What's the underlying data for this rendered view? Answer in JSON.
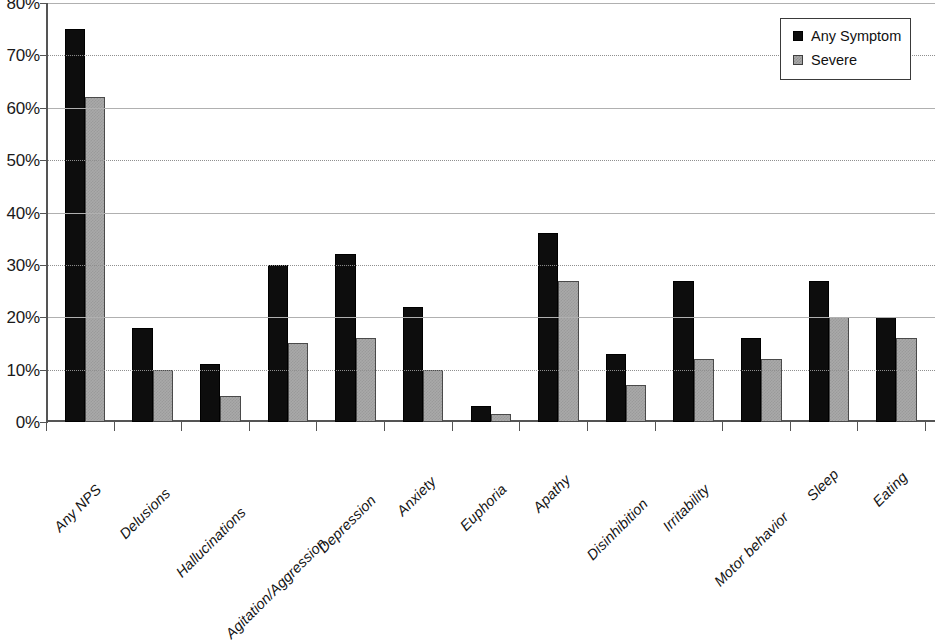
{
  "chart_data": {
    "type": "bar",
    "title": "",
    "subtitle": "",
    "xlabel": "",
    "ylabel": "",
    "ylim": [
      0,
      80
    ],
    "ytick_labels": [
      "0%",
      "10%",
      "20%",
      "30%",
      "40%",
      "50%",
      "60%",
      "70%",
      "80%"
    ],
    "ytick_values": [
      0,
      10,
      20,
      30,
      40,
      50,
      60,
      70,
      80
    ],
    "grid": true,
    "grid_axis": "y",
    "legend_position": "top-right",
    "categories": [
      "Any NPS",
      "Delusions",
      "Hallucinations",
      "Agitation/Aggression",
      "Depression",
      "Anxiety",
      "Euphoria",
      "Apathy",
      "Disinhibition",
      "Irritability",
      "Motor behavior",
      "Sleep",
      "Eating"
    ],
    "series": [
      {
        "name": "Any Symptom",
        "color": "#0d0d0d",
        "values": [
          75,
          18,
          11,
          30,
          32,
          22,
          3,
          36,
          13,
          27,
          16,
          27,
          20
        ]
      },
      {
        "name": "Severe",
        "color": "#a9a9a9",
        "values": [
          62,
          10,
          5,
          15,
          16,
          10,
          1.5,
          27,
          7,
          12,
          12,
          20,
          16
        ]
      }
    ]
  },
  "legend": {
    "items": [
      {
        "label": "Any Symptom",
        "swatch": "black-square"
      },
      {
        "label": "Severe",
        "swatch": "gray-square"
      }
    ]
  }
}
